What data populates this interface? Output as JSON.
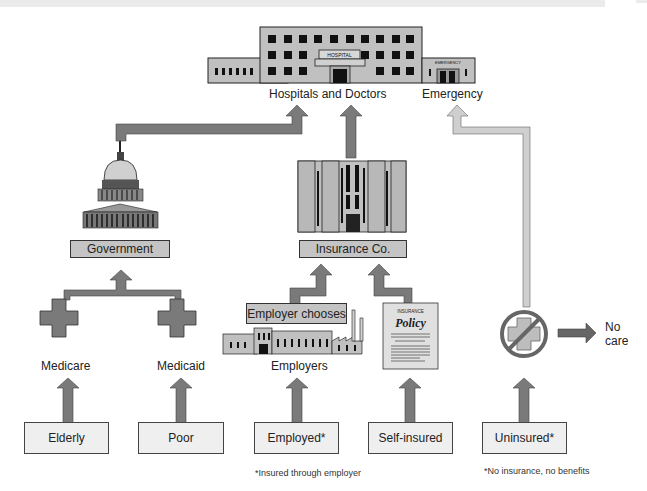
{
  "colors": {
    "arrow_dark": "#777777",
    "arrow_light": "#c8c8c8",
    "box_fill": "#c4c4c4",
    "source_box_fill": "#efefef",
    "building_fill": "#c0c0c0",
    "outline": "#333333"
  },
  "hospital": {
    "sign": "HOSPITAL",
    "emergency_sign": "EMERGENCY",
    "label_main": "Hospitals and Doctors",
    "label_emergency": "Emergency"
  },
  "government": {
    "label": "Government",
    "icon": "capitol-icon"
  },
  "insurance": {
    "label": "Insurance Co.",
    "icon": "office-building-icon"
  },
  "programs": [
    {
      "label": "Medicare",
      "icon": "cross-icon"
    },
    {
      "label": "Medicaid",
      "icon": "cross-icon"
    }
  ],
  "employer": {
    "chooses_label": "Employer chooses",
    "label": "Employers",
    "icon": "factory-icon"
  },
  "policy": {
    "title_small": "INSURANCE",
    "title": "Policy",
    "icon": "policy-document-icon"
  },
  "uninsured_outcome": {
    "icon": "no-care-icon",
    "label_line1": "No",
    "label_line2": "care"
  },
  "sources": [
    {
      "label": "Elderly"
    },
    {
      "label": "Poor"
    },
    {
      "label": "Employed*"
    },
    {
      "label": "Self-insured"
    },
    {
      "label": "Uninsured*"
    }
  ],
  "footnotes": {
    "employed": "*Insured through employer",
    "uninsured": "*No insurance, no benefits"
  }
}
